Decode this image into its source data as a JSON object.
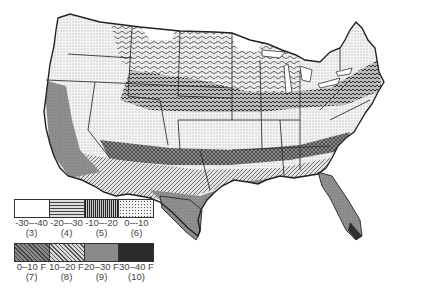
{
  "map": {
    "subject": "Contiguous United States — average annual minimum temperature zones",
    "states_outlined": true
  },
  "legend": {
    "row1": [
      {
        "range": "-30–-40",
        "zone": "(3)",
        "pattern": "blank",
        "color": "#ffffff"
      },
      {
        "range": "-20–-30",
        "zone": "(4)",
        "pattern": "wavy-lines",
        "color": "#d8d8d8"
      },
      {
        "range": "-10–-20",
        "zone": "(5)",
        "pattern": "dense-waves",
        "color": "#9a9a9a"
      },
      {
        "range": "0–-10",
        "zone": "(6)",
        "pattern": "stipple-dots",
        "color": "#e6e6e6"
      }
    ],
    "row2": [
      {
        "range": "0–10 F",
        "zone": "(7)",
        "pattern": "cross-hatch",
        "color": "#707070"
      },
      {
        "range": "10–20 F",
        "zone": "(8)",
        "pattern": "diagonal-hatch",
        "color": "#b4b4b4"
      },
      {
        "range": "20–30 F",
        "zone": "(9)",
        "pattern": "gray-fill",
        "color": "#888888"
      },
      {
        "range": "30–40 F",
        "zone": "(10)",
        "pattern": "dark-fill",
        "color": "#2a2a2a"
      }
    ]
  }
}
